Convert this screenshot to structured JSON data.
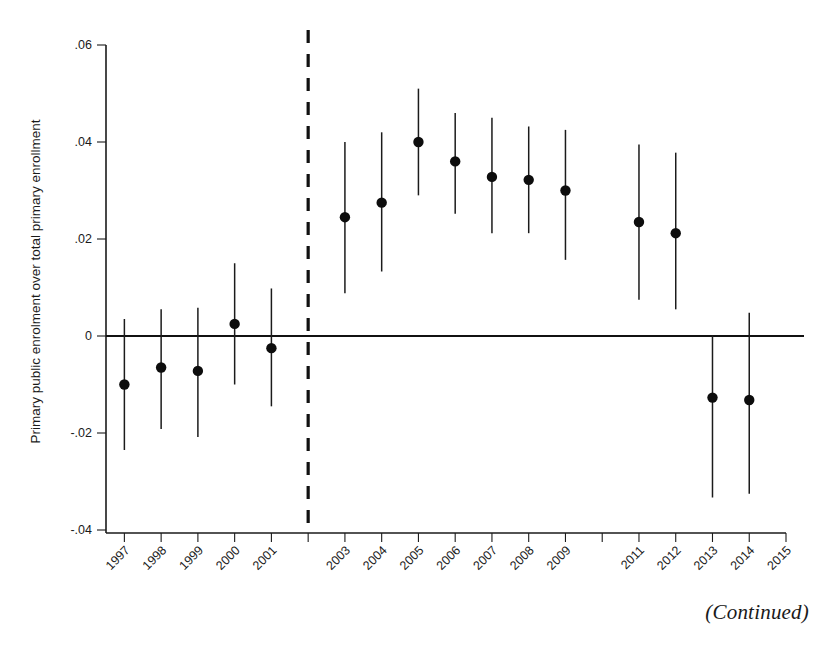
{
  "figure": {
    "continued_note": "(Continued)",
    "y_axis_label": "Primary public enrolment over total primary enrollment",
    "marker_color": "#0d0d0d",
    "line_color": "#1b1b1b",
    "reference_line_color": "#111111"
  },
  "chart_data": {
    "type": "scatter",
    "title": "",
    "subtitle": "",
    "xlabel": "",
    "ylabel": "Primary public enrolment over total primary enrollment",
    "grid": false,
    "legend": "none",
    "ylim": [
      -0.05,
      0.065
    ],
    "yticks": [
      0.06,
      0.04,
      0.02,
      0,
      -0.02,
      -0.04
    ],
    "ytick_labels": [
      ".06",
      ".04",
      ".02",
      "0",
      "-.02",
      "-.04"
    ],
    "xlim": [
      1996.5,
      2015.0
    ],
    "xticks": [
      1997,
      1998,
      1999,
      2000,
      2001,
      2002,
      2003,
      2004,
      2005,
      2006,
      2007,
      2008,
      2009,
      2010,
      2011,
      2012,
      2013,
      2014,
      2015
    ],
    "xtick_labels": [
      "1997",
      "1998",
      "1999",
      "2000",
      "2001",
      "",
      "2003",
      "2004",
      "2005",
      "2006",
      "2007",
      "2008",
      "2009",
      "",
      "2011",
      "2012",
      "2013",
      "2014",
      "2015"
    ],
    "reference_line_x": 2002,
    "zero_line_y": 0,
    "categories": [
      "1997",
      "1998",
      "1999",
      "2000",
      "2001",
      "2003",
      "2004",
      "2005",
      "2006",
      "2007",
      "2008",
      "2009",
      "2011",
      "2012",
      "2013",
      "2014"
    ],
    "x": [
      1997,
      1998,
      1999,
      2000,
      2001,
      2003,
      2004,
      2005,
      2006,
      2007,
      2008,
      2009,
      2011,
      2012,
      2013,
      2014
    ],
    "values": [
      -0.01,
      -0.0065,
      -0.0072,
      0.0025,
      -0.0025,
      0.0245,
      0.0275,
      0.04,
      0.036,
      0.0328,
      0.0322,
      0.03,
      0.0235,
      0.0212,
      -0.0127,
      -0.0132
    ],
    "ci_lower": [
      -0.0235,
      -0.0192,
      -0.0208,
      -0.01,
      -0.0145,
      0.0088,
      0.0133,
      0.029,
      0.0252,
      0.0212,
      0.0212,
      0.0157,
      0.0075,
      0.0055,
      -0.0333,
      -0.0325
    ],
    "ci_upper": [
      0.0035,
      0.0055,
      0.0058,
      0.015,
      0.0098,
      0.04,
      0.042,
      0.051,
      0.046,
      0.045,
      0.0432,
      0.0425,
      0.0395,
      0.0378,
      0.0002,
      0.0048
    ],
    "annotations": [
      {
        "text": "(Continued)",
        "position": "bottom-right"
      }
    ]
  }
}
